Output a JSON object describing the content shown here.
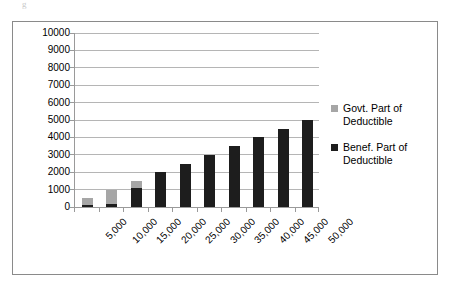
{
  "artifact": {
    "glyph": "g"
  },
  "chart_data": {
    "type": "bar",
    "subtype": "stacked-column",
    "title": "",
    "xlabel": "",
    "ylabel": "",
    "categories": [
      "5,000",
      "10,000",
      "15,000",
      "20,000",
      "25,000",
      "30,000",
      "35,000",
      "40,000",
      "45,000",
      "50,000"
    ],
    "series": [
      {
        "name": "Benef. Part of Deductible",
        "color": "#1d1d1d",
        "values": [
          100,
          200,
          1100,
          2000,
          2500,
          3000,
          3500,
          4000,
          4500,
          5000
        ]
      },
      {
        "name": "Govt. Part of Deductible",
        "color": "#a6a6a6",
        "values": [
          400,
          800,
          400,
          0,
          0,
          0,
          0,
          0,
          0,
          0
        ]
      }
    ],
    "totals": [
      500,
      1000,
      1500,
      2000,
      2500,
      3000,
      3500,
      4000,
      4500,
      5000
    ],
    "ylim": [
      0,
      10000
    ],
    "ytick_values": [
      0,
      1000,
      2000,
      3000,
      4000,
      5000,
      6000,
      7000,
      8000,
      9000,
      10000
    ],
    "ytick_labels": [
      "0",
      "1000",
      "2000",
      "3000",
      "4000",
      "5000",
      "6000",
      "7000",
      "8000",
      "9000",
      "10000"
    ],
    "grid": true,
    "grid_axis": "y",
    "legend_position": "right",
    "legend": [
      {
        "label": "Govt. Part of Deductible",
        "color": "#a6a6a6"
      },
      {
        "label": "Benef. Part of Deductible",
        "color": "#1d1d1d"
      }
    ],
    "xtick_label_rotation": -45,
    "border_color": "#8a8a8a",
    "gridline_color": "#b5b5b5",
    "plot_background": "#ffffff"
  }
}
